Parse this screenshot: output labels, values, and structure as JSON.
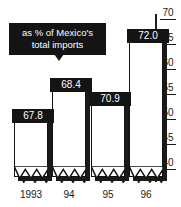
{
  "chart_data": {
    "type": "bar",
    "title": "",
    "subtitle": "",
    "annotation": "as % of Mexico's total imports",
    "annotation_line1": "as % of Mexico's",
    "annotation_line2": "total imports",
    "categories": [
      "1993",
      "94",
      "95",
      "96"
    ],
    "values": [
      67.8,
      68.4,
      70.9,
      72.0
    ],
    "value_labels": [
      "67.8",
      "68.4",
      "70.9",
      "72.0"
    ],
    "xlabel": "",
    "ylabel": "",
    "ylim": [
      38,
      71.5
    ],
    "yticks": [
      70,
      65,
      60,
      55,
      50,
      45,
      40
    ],
    "ytick_labels": [
      "70",
      "65",
      "60",
      "55",
      "50",
      "45",
      "40"
    ],
    "grid": false,
    "legend": false,
    "axis_break": true,
    "colors": {
      "bar_fill": "#ffffff",
      "bar_outline": "#111111",
      "bar_shadow": "#1a1a1a",
      "label_box": "#141414",
      "label_text": "#ffffff",
      "axis": "#1d1d1d",
      "background": "#ffffff"
    }
  },
  "bars": [
    {
      "label": "1993",
      "value_label": "67.8",
      "left": 14,
      "width": 34,
      "height": 66,
      "flag_left": 12,
      "flag_top": 109,
      "flag_width": 42,
      "cat_left": 8,
      "cat_width": 46
    },
    {
      "label": "94",
      "value_label": "68.4",
      "left": 52,
      "width": 34,
      "height": 97,
      "flag_left": 50,
      "flag_top": 78,
      "flag_width": 42,
      "cat_left": 46,
      "cat_width": 46
    },
    {
      "label": "95",
      "value_label": "70.9",
      "left": 91,
      "width": 34,
      "height": 83,
      "flag_left": 89,
      "flag_top": 92,
      "flag_width": 42,
      "cat_left": 85,
      "cat_width": 46
    },
    {
      "label": "96",
      "value_label": "72.0",
      "left": 129,
      "width": 34,
      "height": 146,
      "flag_left": 127,
      "flag_top": 29,
      "flag_width": 42,
      "cat_left": 123,
      "cat_width": 46
    }
  ],
  "yticks": [
    {
      "label": "70",
      "top": 7
    },
    {
      "label": "65",
      "top": 32
    },
    {
      "label": "60",
      "top": 57
    },
    {
      "label": "55",
      "top": 82
    },
    {
      "label": "50",
      "top": 107
    },
    {
      "label": "45",
      "top": 132
    },
    {
      "label": "40",
      "top": 157
    }
  ]
}
